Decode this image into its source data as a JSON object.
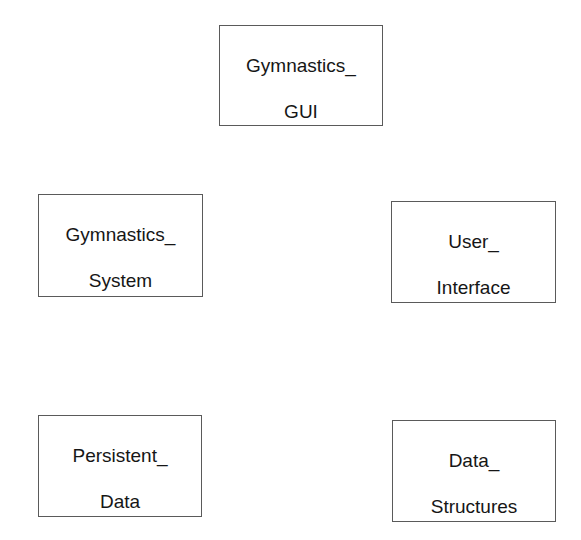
{
  "diagram": {
    "type": "package-diagram",
    "boxes": [
      {
        "id": "gymnastics-gui",
        "line1": "Gymnastics_",
        "line2": "GUI",
        "bounds": {
          "x": 219,
          "y": 25,
          "w": 164,
          "h": 101
        }
      },
      {
        "id": "gymnastics-system",
        "line1": "Gymnastics_",
        "line2": "System",
        "bounds": {
          "x": 38,
          "y": 194,
          "w": 165,
          "h": 103
        }
      },
      {
        "id": "user-interface",
        "line1": "User_",
        "line2": "Interface",
        "bounds": {
          "x": 391,
          "y": 201,
          "w": 165,
          "h": 102
        }
      },
      {
        "id": "persistent-data",
        "line1": "Persistent_",
        "line2": "Data",
        "bounds": {
          "x": 38,
          "y": 415,
          "w": 164,
          "h": 102
        }
      },
      {
        "id": "data-structures",
        "line1": "Data_",
        "line2": "Structures",
        "bounds": {
          "x": 392,
          "y": 420,
          "w": 164,
          "h": 102
        }
      }
    ],
    "colors": {
      "border": "#5a5a5a",
      "text": "#161616",
      "background": "#ffffff"
    }
  }
}
